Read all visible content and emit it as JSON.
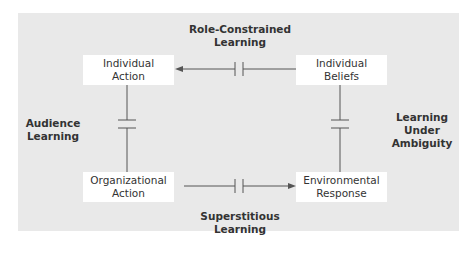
{
  "diagram": {
    "nodes": {
      "individual_action": [
        "Individual",
        "Action"
      ],
      "individual_beliefs": [
        "Individual",
        "Beliefs"
      ],
      "organizational_action": [
        "Organizational",
        "Action"
      ],
      "environmental_response": [
        "Environmental",
        "Response"
      ]
    },
    "labels": {
      "role_constrained": [
        "Role-Constrained",
        "Learning"
      ],
      "audience": [
        "Audience",
        "Learning"
      ],
      "ambiguity": [
        "Learning",
        "Under",
        "Ambiguity"
      ],
      "superstitious": [
        "Superstitious",
        "Learning"
      ]
    },
    "colors": {
      "panel": "#e9e9e9",
      "box": "#ffffff",
      "line": "#555555",
      "text": "#333333"
    }
  }
}
